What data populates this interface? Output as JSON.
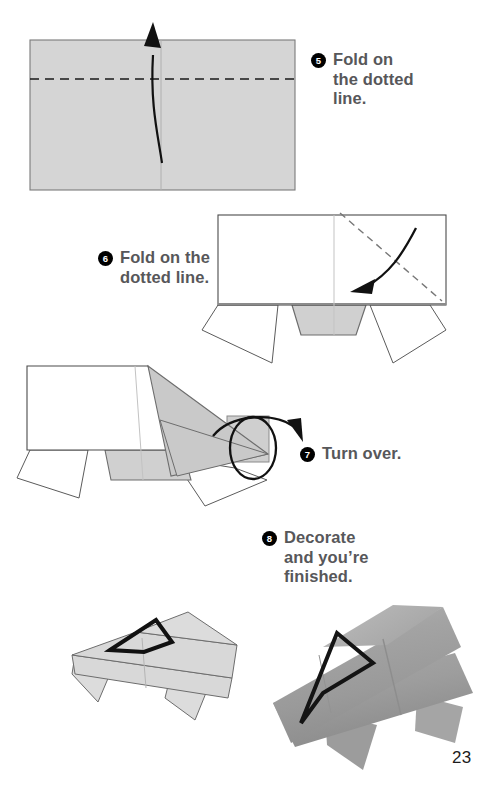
{
  "page": {
    "number": "23",
    "background_color": "#ffffff",
    "paper_fill": "#d5d5d5",
    "paper_stroke": "#6e6e6e",
    "text_color": "#57575a",
    "badge_color": "#000000"
  },
  "steps": [
    {
      "number": "5",
      "text": "Fold on\nthe dotted\nline.",
      "diagram": "rectangle-with-horizontal-dotted-fold-line-and-up-arrow"
    },
    {
      "number": "6",
      "text": "Fold on the\ndotted line.",
      "diagram": "rectangle-with-diagonal-dotted-fold-line-and-down-arrow"
    },
    {
      "number": "7",
      "text": "Turn over.",
      "diagram": "folded-model-with-turn-over-loop-arrow"
    },
    {
      "number": "8",
      "text": "Decorate\nand you’re\nfinished.",
      "diagram": "finished-model-line-drawing-and-photo"
    }
  ],
  "figures": {
    "step5": {
      "name": "folded-rectangle-diagram",
      "fold_line_style": "dashed",
      "arrow_direction": "up"
    },
    "step6": {
      "name": "rectangle-with-legs-diagram",
      "fold_line_style": "dashed-diagonal",
      "arrow_direction": "down-left"
    },
    "step7": {
      "name": "side-view-model-diagram",
      "symbol": "turn-over-loop"
    },
    "step8": {
      "name": "finished-origami-car-diagram",
      "window_shape": "triangle-outline"
    }
  },
  "photo": {
    "name": "finished-model-photograph",
    "caption": "",
    "description_colors": [
      "#9b9b9b",
      "#b4b4b4",
      "#8a8a8a"
    ]
  }
}
